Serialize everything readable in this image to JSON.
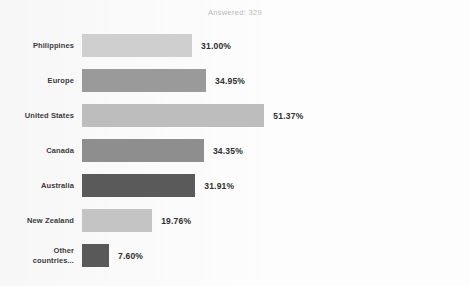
{
  "header": {
    "answered_text": "Answered: 329"
  },
  "chart_data": {
    "type": "bar",
    "orientation": "horizontal",
    "title": "",
    "subtitle": "Answered: 329",
    "xlabel": "",
    "ylabel": "",
    "xlim": [
      0,
      100
    ],
    "grid": false,
    "legend": "none",
    "value_suffix": "%",
    "categories": [
      "Philippines",
      "Europe",
      "United States",
      "Canada",
      "Australia",
      "New Zealand",
      "Other countries..."
    ],
    "values": [
      31.0,
      34.95,
      51.37,
      34.35,
      31.91,
      19.76,
      7.6
    ],
    "labels": [
      "31.00%",
      "34.95%",
      "51.37%",
      "34.35%",
      "31.91%",
      "19.76%",
      "7.60%"
    ],
    "bar_colors": [
      "#cfcfcf",
      "#9a9a9a",
      "#bdbdbd",
      "#8e8e8e",
      "#5a5a5a",
      "#c4c4c4",
      "#595959"
    ],
    "bars": [
      {
        "category": "Philippines",
        "label_line1": "Philippines",
        "label_line2": "",
        "value": 31.0,
        "label": "31.00%",
        "color": "#cfcfcf"
      },
      {
        "category": "Europe",
        "label_line1": "Europe",
        "label_line2": "",
        "value": 34.95,
        "label": "34.95%",
        "color": "#9a9a9a"
      },
      {
        "category": "United States",
        "label_line1": "United States",
        "label_line2": "",
        "value": 51.37,
        "label": "51.37%",
        "color": "#bdbdbd"
      },
      {
        "category": "Canada",
        "label_line1": "Canada",
        "label_line2": "",
        "value": 34.35,
        "label": "34.35%",
        "color": "#8e8e8e"
      },
      {
        "category": "Australia",
        "label_line1": "Australia",
        "label_line2": "",
        "value": 31.91,
        "label": "31.91%",
        "color": "#5a5a5a"
      },
      {
        "category": "New Zealand",
        "label_line1": "New Zealand",
        "label_line2": "",
        "value": 19.76,
        "label": "19.76%",
        "color": "#c4c4c4"
      },
      {
        "category": "Other countries...",
        "label_line1": "Other",
        "label_line2": "countries...",
        "value": 7.6,
        "label": "7.60%",
        "color": "#595959"
      }
    ]
  },
  "style": {
    "background": "#fdfdfd",
    "label_color": "#3b3b3b",
    "value_color": "#2f2f2f",
    "answered_color": "#b9b9b9"
  }
}
